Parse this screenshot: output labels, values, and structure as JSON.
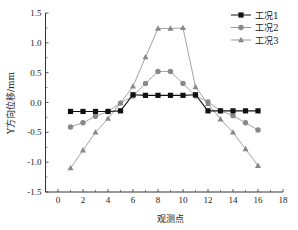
{
  "chart_data": {
    "type": "line",
    "title": "",
    "xlabel": "观测点",
    "ylabel": "Y方向位移/mm",
    "xlim": [
      -1,
      18
    ],
    "ylim": [
      -1.5,
      1.5
    ],
    "xticks": [
      0,
      2,
      4,
      6,
      8,
      10,
      12,
      14,
      16,
      18
    ],
    "yticks": [
      -1.5,
      -1.0,
      -0.5,
      0.0,
      0.5,
      1.0,
      1.5
    ],
    "ytick_labels": [
      "-1.5",
      "-1.0",
      "-0.5",
      "0.0",
      "0.5",
      "1.0",
      "1.5"
    ],
    "grid": false,
    "legend_position": "upper right",
    "x": [
      1,
      2,
      3,
      4,
      5,
      6,
      7,
      8,
      9,
      10,
      11,
      12,
      13,
      14,
      15,
      16
    ],
    "series": [
      {
        "name": "工况1",
        "marker": "square",
        "color": "#111111",
        "values": [
          -0.15,
          -0.15,
          -0.15,
          -0.15,
          -0.14,
          0.13,
          0.12,
          0.12,
          0.12,
          0.12,
          0.13,
          -0.14,
          -0.14,
          -0.14,
          -0.14,
          -0.14
        ]
      },
      {
        "name": "工况2",
        "marker": "circle",
        "color": "#888888",
        "values": [
          -0.41,
          -0.34,
          -0.23,
          -0.15,
          -0.01,
          0.11,
          0.32,
          0.52,
          0.52,
          0.32,
          0.11,
          0.01,
          -0.14,
          -0.22,
          -0.34,
          -0.46
        ]
      },
      {
        "name": "工况3",
        "marker": "triangle",
        "color": "#888888",
        "values": [
          -1.1,
          -0.8,
          -0.5,
          -0.27,
          -0.01,
          0.27,
          0.76,
          1.24,
          1.24,
          1.25,
          0.26,
          -0.02,
          -0.28,
          -0.5,
          -0.78,
          -1.06
        ]
      }
    ]
  }
}
